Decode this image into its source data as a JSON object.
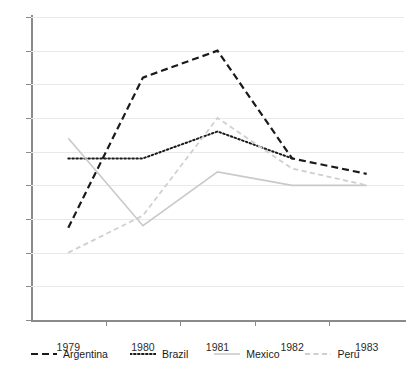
{
  "chart_data": {
    "type": "line",
    "title": "",
    "subtitle": "",
    "xlabel": "",
    "ylabel": "",
    "categories": [
      "1979",
      "1980",
      "1981",
      "1982",
      "1983"
    ],
    "ylim": [
      40,
      85
    ],
    "yticks": [
      40,
      45,
      50,
      55,
      60,
      65,
      70,
      75,
      80,
      85
    ],
    "ytick_labels": [
      "40",
      "45",
      "50",
      "55",
      "60",
      "65",
      "70",
      "75",
      "80",
      "85"
    ],
    "grid": true,
    "legend_position": "bottom",
    "series": [
      {
        "name": "Argentina",
        "style": "dashed",
        "color": "#1a1a1a",
        "width": 2.2,
        "values": [
          53.7,
          76.0,
          80.0,
          64.0,
          61.7
        ]
      },
      {
        "name": "Brazil",
        "style": "dotted",
        "color": "#1a1a1a",
        "width": 2.0,
        "values": [
          64.0,
          64.0,
          68.0,
          64.0,
          null
        ]
      },
      {
        "name": "Mexico",
        "style": "solid",
        "color": "#c9c9c9",
        "width": 1.6,
        "values": [
          67.0,
          54.0,
          62.0,
          60.0,
          60.0
        ]
      },
      {
        "name": "Peru",
        "style": "dashed",
        "color": "#cfcfcf",
        "width": 1.8,
        "values": [
          50.0,
          55.5,
          70.0,
          62.5,
          60.0
        ]
      }
    ]
  },
  "legend": {
    "items": [
      {
        "label": "Argentina",
        "swatch": "dashed-dark-line-icon"
      },
      {
        "label": "Brazil",
        "swatch": "dotted-dark-line-icon"
      },
      {
        "label": "Mexico",
        "swatch": "solid-gray-line-icon"
      },
      {
        "label": "Peru",
        "swatch": "dashed-gray-line-icon"
      }
    ]
  },
  "axes": {
    "y_tick_labels": [
      "85",
      "80",
      "75",
      "70",
      "65",
      "60",
      "55",
      "50",
      "45",
      "40"
    ],
    "x_tick_labels": [
      "1979",
      "1980",
      "1981",
      "1982",
      "1983"
    ]
  }
}
